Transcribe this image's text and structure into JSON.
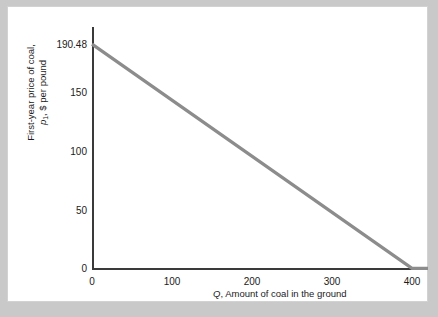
{
  "figure": {
    "background_color": "#ffffff",
    "outer_background_color": "#c9c9c9",
    "axis_color": "#3a3a3a",
    "curve_color": "#8c8c8c"
  },
  "chart_data": {
    "type": "line",
    "title": "",
    "xlabel_prefix": "Q",
    "xlabel_rest": ", Amount of coal in the ground",
    "ylabel_line1": "First-year price of coal,",
    "ylabel_line2_prefix": "p",
    "ylabel_line2_sub": "1",
    "ylabel_line2_rest": ", $ per pound",
    "xlim": [
      0,
      420
    ],
    "ylim": [
      0,
      205
    ],
    "xticks": [
      "0",
      "100",
      "200",
      "300",
      "400"
    ],
    "xtick_values": [
      0,
      100,
      200,
      300,
      400
    ],
    "yticks": [
      "0",
      "50",
      "100",
      "150",
      "190.48"
    ],
    "ytick_values": [
      0,
      50,
      100,
      150,
      190.48
    ],
    "grid": false,
    "legend": "none",
    "series": [
      {
        "name": "Demand curve for coal",
        "x": [
          0,
          400
        ],
        "values": [
          190.48,
          0
        ],
        "intercept": 190.48,
        "x_intercept": 400,
        "slope": -0.4762,
        "color": "#8c8c8c",
        "linewidth": 3
      },
      {
        "name": "Zero-price tail",
        "x": [
          400,
          420
        ],
        "values": [
          0,
          0
        ],
        "color": "#8c8c8c",
        "linewidth": 3
      }
    ]
  }
}
